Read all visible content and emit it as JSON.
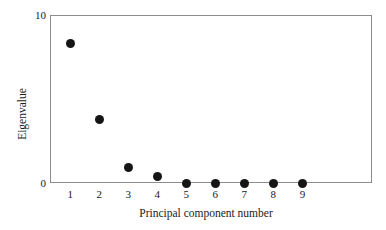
{
  "chart_data": {
    "type": "scatter",
    "title": "",
    "xlabel": "Principal component number",
    "ylabel": "Eigenvalue",
    "categories": [
      "1",
      "2",
      "3",
      "4",
      "5",
      "6",
      "7",
      "8",
      "9"
    ],
    "x": [
      1,
      2,
      3,
      4,
      5,
      6,
      7,
      8,
      9
    ],
    "values": [
      8.3,
      3.8,
      0.9,
      0.4,
      -0.05,
      -0.05,
      -0.05,
      -0.05,
      -0.05
    ],
    "series": [
      {
        "name": "Eigenvalue",
        "values": [
          8.3,
          3.8,
          0.9,
          0.4,
          -0.05,
          -0.05,
          -0.05,
          -0.05,
          -0.05
        ]
      }
    ],
    "xtick_labels": [
      "1",
      "2",
      "3",
      "4",
      "5",
      "6",
      "7",
      "8",
      "9"
    ],
    "ytick_labels": [
      "0",
      "10"
    ],
    "ytick_values": [
      0,
      10
    ],
    "xlim": [
      0.3,
      11.4
    ],
    "ylim": [
      0,
      10
    ],
    "grid": false,
    "legend": false,
    "marker": "filled-circle",
    "marker_color": "#151515",
    "frame_color": "#8c8c8c",
    "background_color": "#ffffff"
  }
}
